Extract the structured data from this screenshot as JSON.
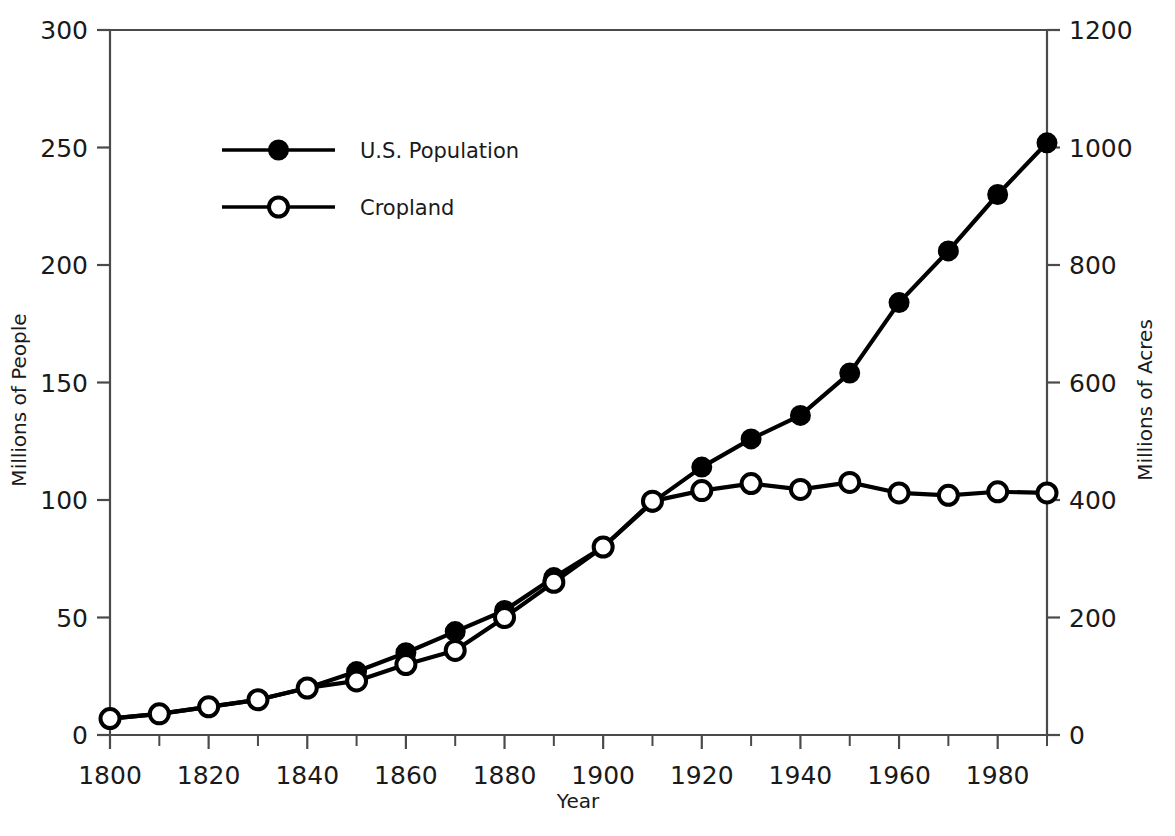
{
  "chart_data": {
    "type": "line",
    "title": "",
    "xlabel": "Year",
    "ylabel": "Millions of People",
    "y2label": "Millions of Acres",
    "xlim": [
      1800,
      1990
    ],
    "ylim": [
      0,
      300
    ],
    "y2lim": [
      0,
      1200
    ],
    "grid": false,
    "legend_position": "upper-left-inside",
    "x": [
      1800,
      1810,
      1820,
      1830,
      1840,
      1850,
      1860,
      1870,
      1880,
      1890,
      1900,
      1910,
      1920,
      1930,
      1940,
      1950,
      1960,
      1970,
      1980,
      1990
    ],
    "xtick_labels": [
      "1800",
      "1820",
      "1840",
      "1860",
      "1880",
      "1900",
      "1920",
      "1940",
      "1960",
      "1980"
    ],
    "xticks_major": [
      1800,
      1820,
      1840,
      1860,
      1880,
      1900,
      1920,
      1940,
      1960,
      1980
    ],
    "xticks_minor": [
      1810,
      1830,
      1850,
      1870,
      1890,
      1910,
      1930,
      1950,
      1970,
      1990
    ],
    "ytick_labels": [
      "0",
      "50",
      "100",
      "150",
      "200",
      "250",
      "300"
    ],
    "yticks": [
      0,
      50,
      100,
      150,
      200,
      250,
      300
    ],
    "y2tick_labels": [
      "0",
      "200",
      "400",
      "600",
      "800",
      "1000",
      "1200"
    ],
    "y2ticks": [
      0,
      200,
      400,
      600,
      800,
      1000,
      1200
    ],
    "series": [
      {
        "name": "U.S. Population",
        "axis": "left",
        "marker": "filled-circle",
        "units": "millions of people",
        "x": [
          1800,
          1810,
          1820,
          1830,
          1840,
          1850,
          1860,
          1870,
          1880,
          1890,
          1900,
          1910,
          1920,
          1930,
          1940,
          1950,
          1960,
          1970,
          1980,
          1990
        ],
        "values": [
          7,
          9,
          12,
          15,
          20,
          27,
          35,
          44,
          53,
          67,
          80,
          99,
          114,
          126,
          136,
          154,
          184,
          206,
          230,
          252
        ]
      },
      {
        "name": "Cropland",
        "axis": "right",
        "marker": "open-circle",
        "units": "millions of acres",
        "x": [
          1800,
          1810,
          1820,
          1830,
          1840,
          1850,
          1860,
          1870,
          1880,
          1890,
          1900,
          1910,
          1920,
          1930,
          1940,
          1950,
          1960,
          1970,
          1980,
          1990
        ],
        "values": [
          28,
          36,
          48,
          60,
          80,
          92,
          120,
          144,
          200,
          260,
          320,
          398,
          416,
          428,
          418,
          430,
          412,
          408,
          414,
          412
        ]
      }
    ],
    "legend": [
      {
        "label": "U.S. Population",
        "marker": "filled-circle"
      },
      {
        "label": "Cropland",
        "marker": "open-circle"
      }
    ]
  }
}
